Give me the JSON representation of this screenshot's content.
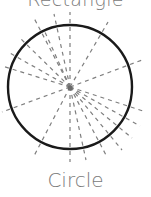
{
  "labels": {
    "top": "Rectangle",
    "bottom": "Circle"
  },
  "diagram": {
    "shape": "circle",
    "center": [
      70,
      87
    ],
    "radius": 62,
    "stroke_color": "#1a1a1a",
    "line_color": "#7f7f7f",
    "symmetry_lines": "infinite radial dashed lines through center"
  }
}
